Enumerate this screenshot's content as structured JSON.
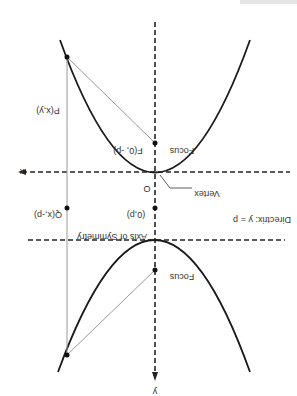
{
  "diagram": {
    "orientation": "rotated-180",
    "labels": {
      "x_axis": "x",
      "y_axis": "y",
      "origin": "O",
      "vertex": "Vertex",
      "focus_upper": "Focus",
      "focus_upper_coords": "F(0, -p)",
      "focus_lower": "Focus",
      "point_p": "P(x,y)",
      "point_q": "Q(x,-p)",
      "directrix_point": "(0,p)",
      "directrix": "Directrix: y = p",
      "axis_symmetry": "Axis of Symmetry"
    },
    "colors": {
      "curve": "#1a1a1a",
      "axis": "#222222",
      "helper_line": "#999999"
    }
  }
}
